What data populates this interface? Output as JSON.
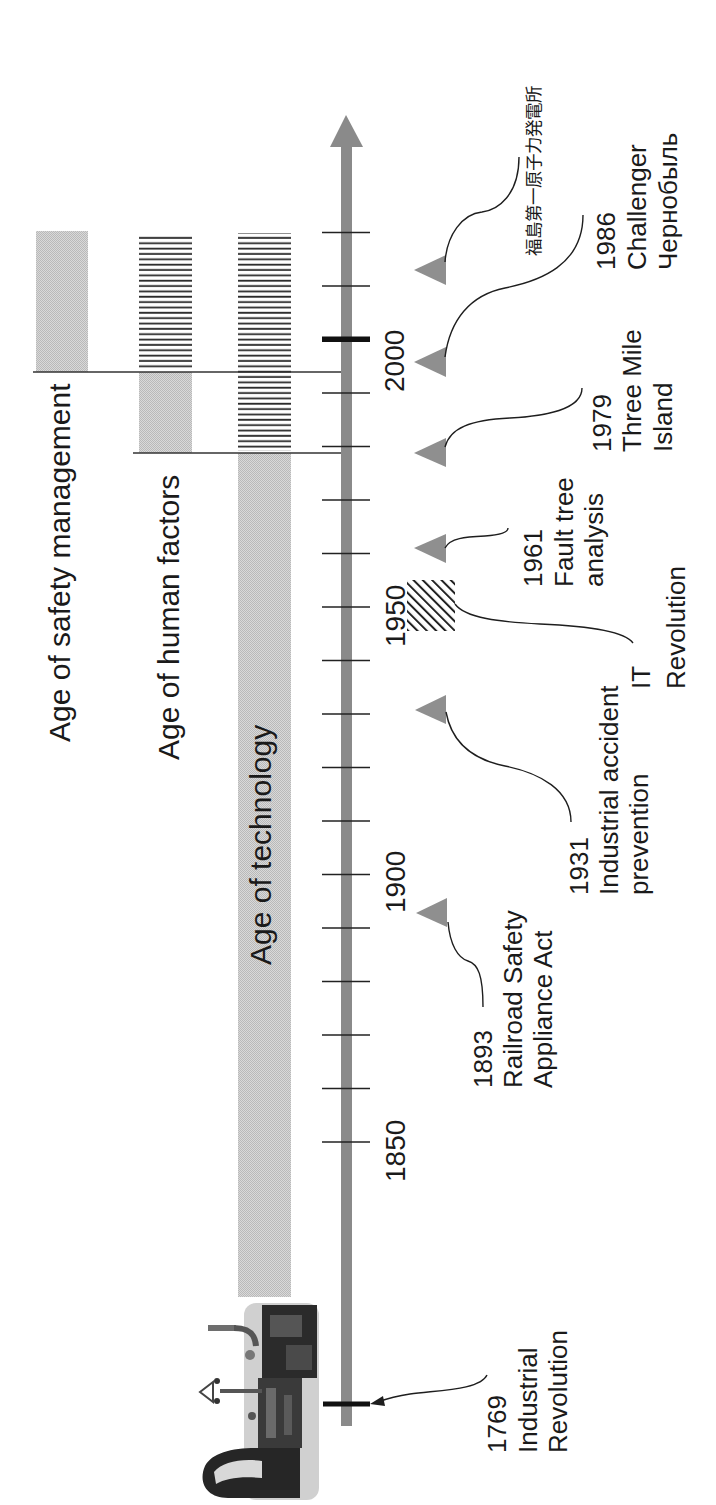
{
  "diagram": {
    "type": "timeline",
    "orientation": "rotated 90 degrees counter-clockwise (time runs bottom to top)"
  },
  "axis": {
    "tick_labels": [
      "2000",
      "1950",
      "1900",
      "1850"
    ],
    "tick_interval_years": 10,
    "highlighted_ticks": [
      "2000",
      "1769"
    ]
  },
  "eras": [
    {
      "label": "Age of safety management"
    },
    {
      "label": "Age of human factors"
    },
    {
      "label": "Age of technology"
    }
  ],
  "events": [
    {
      "year": "1769",
      "lines": [
        "Industrial",
        "Revolution"
      ],
      "marker": "bold-tick-arrow"
    },
    {
      "year": "1893",
      "lines": [
        "Railroad Safety",
        "Appliance Act"
      ],
      "marker": "triangle"
    },
    {
      "year": "1931",
      "lines": [
        "Industrial accident",
        "prevention"
      ],
      "marker": "triangle"
    },
    {
      "year": "",
      "lines": [
        "IT",
        "Revolution"
      ],
      "marker": "hatched-box"
    },
    {
      "year": "1961",
      "lines": [
        "Fault tree",
        "analysis"
      ],
      "marker": "triangle"
    },
    {
      "year": "1979",
      "lines": [
        "Three Mile",
        "Island"
      ],
      "marker": "triangle"
    },
    {
      "year": "1986",
      "lines": [
        "Challenger",
        "Чернобыль"
      ],
      "marker": "triangle"
    },
    {
      "year": "",
      "lines": [
        "福島第一原子力発電所"
      ],
      "marker": "triangle"
    }
  ],
  "colors": {
    "axis": "#8a8a8a",
    "band": "#cbcbcb",
    "stripe": "#2a2a2a",
    "marker": "#8f8f8f",
    "line": "#1e1e1e",
    "text": "#1a1a1a",
    "background": "#ffffff"
  }
}
